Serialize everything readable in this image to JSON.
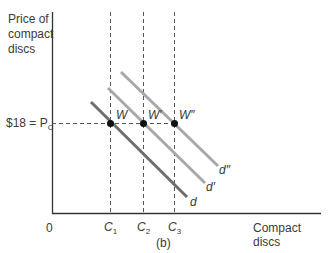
{
  "figure": {
    "panel_label": "(b)",
    "y_axis_label_lines": [
      "Price of",
      "compact",
      "discs"
    ],
    "x_axis_label": "Compact discs",
    "origin_label": "0",
    "price_label": "$18 = P",
    "price_label_sub": "C"
  },
  "quantities": [
    {
      "name": "C",
      "sub": "1"
    },
    {
      "name": "C",
      "sub": "2"
    },
    {
      "name": "C",
      "sub": "3"
    }
  ],
  "points": [
    {
      "label": "W"
    },
    {
      "label": "W′"
    },
    {
      "label": "W″"
    }
  ],
  "curves": [
    {
      "label": "d",
      "color": "#6e6e6e"
    },
    {
      "label": "d′",
      "color": "#a6a6a6"
    },
    {
      "label": "d″",
      "color": "#a6a6a6"
    }
  ],
  "colors": {
    "axis": "#333333",
    "dashed": "#555555",
    "point": "#111111"
  }
}
